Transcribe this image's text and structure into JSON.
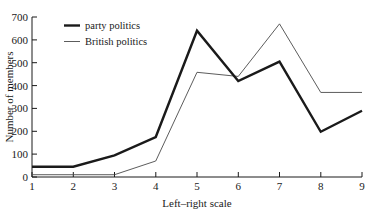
{
  "chart_data": {
    "type": "line",
    "title": "",
    "xlabel": "Left–right scale",
    "ylabel": "Number of members",
    "x": [
      1,
      2,
      3,
      4,
      5,
      6,
      7,
      8,
      9
    ],
    "xticklabels": [
      "1",
      "2",
      "3",
      "4",
      "5",
      "6",
      "7",
      "8",
      "9"
    ],
    "yticklabels": [
      "0",
      "100",
      "200",
      "300",
      "400",
      "500",
      "600",
      "700"
    ],
    "yticks": [
      0,
      100,
      200,
      300,
      400,
      500,
      600,
      700
    ],
    "xlim": [
      1,
      9
    ],
    "ylim": [
      0,
      700
    ],
    "grid": false,
    "legend_position": "upper-left-inside",
    "series": [
      {
        "name": "party politics",
        "values": [
          45,
          45,
          95,
          175,
          640,
          420,
          505,
          198,
          290
        ],
        "color": "#1a1a1a",
        "linewidth": "thick"
      },
      {
        "name": "British politics",
        "values": [
          10,
          10,
          10,
          70,
          458,
          440,
          670,
          370,
          370
        ],
        "color": "#4a4a4a",
        "linewidth": "thin"
      }
    ]
  },
  "legend": {
    "entries": [
      {
        "label": "party politics"
      },
      {
        "label": "British politics"
      }
    ]
  },
  "axes": {
    "y_title": "Number of members",
    "x_title": "Left–right scale",
    "y_tick_0": "0",
    "y_tick_100": "100",
    "y_tick_200": "200",
    "y_tick_300": "300",
    "y_tick_400": "400",
    "y_tick_500": "500",
    "y_tick_600": "600",
    "y_tick_700": "700",
    "x_tick_1": "1",
    "x_tick_2": "2",
    "x_tick_3": "3",
    "x_tick_4": "4",
    "x_tick_5": "5",
    "x_tick_6": "6",
    "x_tick_7": "7",
    "x_tick_8": "8",
    "x_tick_9": "9"
  },
  "colors": {
    "ink": "#1a1a1a",
    "thin_line": "#4a4a4a",
    "background": "#ffffff"
  }
}
